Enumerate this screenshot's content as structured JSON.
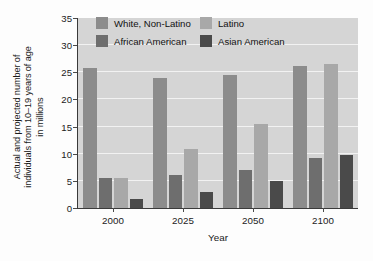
{
  "chart_data": {
    "type": "bar",
    "title": "",
    "xlabel": "Year",
    "ylabel": "Actual and projected number of individuals from 10–19 years of age in millions",
    "ylabel_lines": [
      "Actual and projected number of",
      "individuals from 10–19 years of age",
      "in millions"
    ],
    "categories": [
      "2000",
      "2025",
      "2050",
      "2100"
    ],
    "series": [
      {
        "name": "White, Non-Latino",
        "values": [
          25.8,
          23.9,
          24.5,
          26.1
        ],
        "color": "#8c8c8c"
      },
      {
        "name": "African American",
        "values": [
          5.5,
          6.0,
          7.0,
          9.2
        ],
        "color": "#6e6e6e"
      },
      {
        "name": "Latino",
        "values": [
          5.5,
          10.8,
          15.4,
          26.6
        ],
        "color": "#a8a8a8"
      },
      {
        "name": "Asian American",
        "values": [
          1.6,
          2.9,
          5.0,
          9.8
        ],
        "color": "#4a4a4a"
      }
    ],
    "ylim": [
      0,
      35
    ],
    "ytick_values": [
      0,
      5,
      10,
      15,
      20,
      25,
      30,
      35
    ],
    "ytick_labels": [
      "0",
      "5",
      "10",
      "15",
      "20",
      "25",
      "30",
      "35"
    ],
    "grid": true,
    "grid_color": "#f2f2f2",
    "plot_background": "#d5d5d5",
    "legend_position": "inside-top-left",
    "legend_order": [
      "White, Non-Latino",
      "Latino",
      "African American",
      "Asian American"
    ]
  }
}
